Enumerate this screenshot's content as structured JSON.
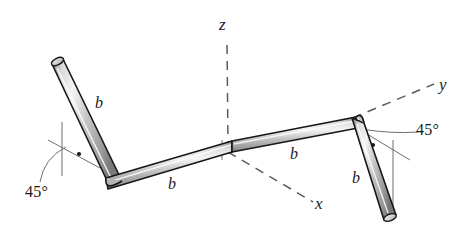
{
  "figure": {
    "background_color": "#ffffff",
    "bar_outline_color": "#171717",
    "bar_fill_light": "#f2f2f2",
    "bar_fill_mid": "#c9c9c9",
    "bar_fill_dark": "#8d8d8d",
    "axis_line_color": "#5b5b5b",
    "thin_line_color": "#6e6e6e",
    "text_color": "#1a1a1a"
  },
  "axes": [
    {
      "name": "z-axis",
      "label": "z",
      "style": "dashed",
      "direction": "up"
    },
    {
      "name": "y-axis",
      "label": "y",
      "style": "dashed",
      "direction": "upper-right"
    },
    {
      "name": "x-axis",
      "label": "x",
      "style": "dashed",
      "direction": "lower-right"
    }
  ],
  "segment_labels": [
    {
      "name": "segment-label-1",
      "text": "b"
    },
    {
      "name": "segment-label-2",
      "text": "b"
    },
    {
      "name": "segment-label-3",
      "text": "b"
    },
    {
      "name": "segment-label-4",
      "text": "b"
    }
  ],
  "angle_labels": [
    {
      "name": "angle-label-left",
      "text": "45°"
    },
    {
      "name": "angle-label-right",
      "text": "45°"
    }
  ]
}
